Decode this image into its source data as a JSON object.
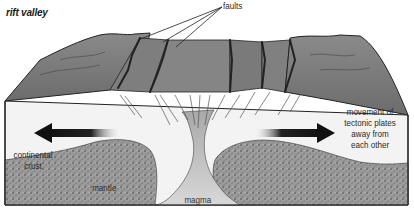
{
  "title": "rift valley",
  "labels": {
    "faults": "faults",
    "movement": "movement of tectonic plates away from each other",
    "movement_lines": [
      "movement of",
      "tectonic plates",
      "away from",
      "each other"
    ],
    "continental_crust_lines": [
      "continental",
      "crust"
    ],
    "mantle": "mantle",
    "magma": "magma"
  },
  "colors": {
    "surface": "#7a7a7a",
    "crust": "#f2f2f2",
    "mantle": "#8c8c8c",
    "magma": "#d6d6d6",
    "arrow": "#1a1a1a",
    "outline": "#222222"
  }
}
